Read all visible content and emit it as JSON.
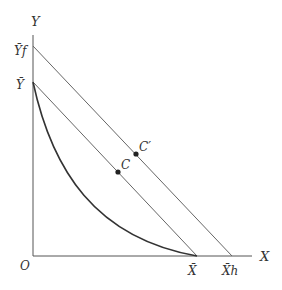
{
  "diagram": {
    "axes": {
      "x_label": "X",
      "y_label": "Y",
      "origin_label": "O"
    },
    "y_intercepts": {
      "y_bar": "Ȳ",
      "y_f": "Ȳf"
    },
    "x_intercepts": {
      "x_bar": "X̄",
      "x_h": "X̄h"
    },
    "points": {
      "c": "C",
      "c_prime": "C′"
    },
    "colors": {
      "line": "#555555",
      "curve": "#333333",
      "text": "#333333"
    }
  }
}
